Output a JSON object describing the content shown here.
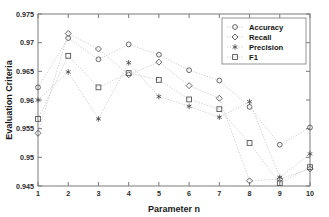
{
  "chart_data": {
    "type": "line",
    "title": "",
    "xlabel": "Parameter n",
    "ylabel": "Evaluation Criteria",
    "x": [
      1,
      2,
      3,
      4,
      5,
      6,
      7,
      8,
      9,
      10
    ],
    "xlim": [
      1,
      10
    ],
    "ylim": [
      0.945,
      0.975
    ],
    "xticks": [
      "1",
      "2",
      "3",
      "4",
      "5",
      "6",
      "7",
      "8",
      "9",
      "10"
    ],
    "yticks": [
      "0.945",
      "0.95",
      "0.955",
      "0.96",
      "0.965",
      "0.97",
      "0.975"
    ],
    "ytick_values": [
      0.945,
      0.95,
      0.955,
      0.96,
      0.965,
      0.97,
      0.975
    ],
    "grid": false,
    "legend_position": "top-right",
    "line_color": "#c8c8c8",
    "marker_color": "#555555",
    "series": [
      {
        "name": "Accuracy",
        "marker": "circle",
        "values": [
          0.9622,
          0.9708,
          0.9671,
          0.9697,
          0.9679,
          0.9652,
          0.9634,
          0.9588,
          0.9522,
          0.9552
        ]
      },
      {
        "name": "Recall",
        "marker": "diamond",
        "values": [
          0.9542,
          0.9716,
          0.9689,
          0.9644,
          0.9666,
          0.9625,
          0.9603,
          0.9459,
          0.9462,
          0.948
        ]
      },
      {
        "name": "Precision",
        "marker": "star",
        "values": [
          0.96,
          0.9649,
          0.9567,
          0.9665,
          0.9606,
          0.9589,
          0.957,
          0.9597,
          0.9465,
          0.9506
        ]
      },
      {
        "name": "F1",
        "marker": "square",
        "values": [
          0.9567,
          0.9677,
          0.9622,
          0.9647,
          0.9635,
          0.9601,
          0.9584,
          0.9525,
          0.9455,
          0.9483
        ]
      }
    ]
  }
}
